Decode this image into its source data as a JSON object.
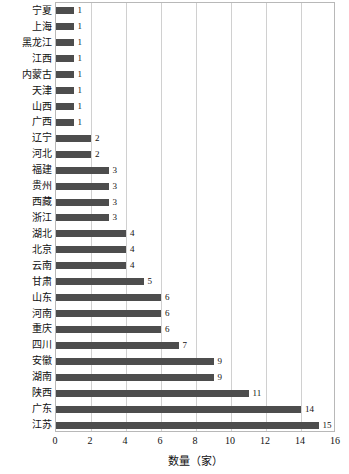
{
  "chart_data": {
    "type": "bar",
    "orientation": "horizontal",
    "title": "",
    "xlabel": "数量（家）",
    "ylabel": "",
    "xlim": [
      0,
      16
    ],
    "xticks": [
      0,
      2,
      4,
      6,
      8,
      10,
      12,
      14,
      16
    ],
    "grid": "vertical",
    "legend": "none",
    "bar_color": "#4d4d4d",
    "gridline_color": "#d0d0d0",
    "axis_border_color": "#b8b8b8",
    "categories": [
      "宁夏",
      "上海",
      "黑龙江",
      "江西",
      "内蒙古",
      "天津",
      "山西",
      "广西",
      "辽宁",
      "河北",
      "福建",
      "贵州",
      "西藏",
      "浙江",
      "湖北",
      "北京",
      "云南",
      "甘肃",
      "山东",
      "河南",
      "重庆",
      "四川",
      "安徽",
      "湖南",
      "陕西",
      "广东",
      "江苏"
    ],
    "values": [
      1,
      1,
      1,
      1,
      1,
      1,
      1,
      1,
      2,
      2,
      3,
      3,
      3,
      3,
      4,
      4,
      4,
      5,
      6,
      6,
      6,
      7,
      9,
      9,
      11,
      14,
      15
    ],
    "data_labels": [
      "1",
      "1",
      "1",
      "1",
      "1",
      "1",
      "1",
      "1",
      "2",
      "2",
      "3",
      "3",
      "3",
      "3",
      "4",
      "4",
      "4",
      "5",
      "6",
      "6",
      "6",
      "7",
      "9",
      "9",
      "11",
      "14",
      "15"
    ]
  }
}
